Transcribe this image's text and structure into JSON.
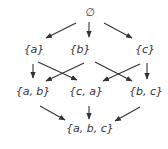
{
  "diagram": {
    "nodes": [
      {
        "id": "empty",
        "label": "∅",
        "x": 90,
        "y": 16
      },
      {
        "id": "a",
        "label": "{a}",
        "x": 34,
        "y": 53
      },
      {
        "id": "b",
        "label": "{b}",
        "x": 80,
        "y": 53
      },
      {
        "id": "c",
        "label": "{c}",
        "x": 145,
        "y": 53
      },
      {
        "id": "ab",
        "label": "{a, b}",
        "x": 33,
        "y": 95
      },
      {
        "id": "ca",
        "label": "{c, a}",
        "x": 86,
        "y": 95
      },
      {
        "id": "bc",
        "label": "{b, c}",
        "x": 146,
        "y": 95
      },
      {
        "id": "abc",
        "label": "{a, b, c}",
        "x": 90,
        "y": 132
      }
    ],
    "edges": [
      {
        "from": "empty",
        "to": "a",
        "x1": 76,
        "y1": 23,
        "x2": 46,
        "y2": 38
      },
      {
        "from": "empty",
        "to": "b",
        "x1": 89,
        "y1": 22,
        "x2": 89,
        "y2": 37
      },
      {
        "from": "empty",
        "to": "c",
        "x1": 104,
        "y1": 23,
        "x2": 132,
        "y2": 38
      },
      {
        "from": "a",
        "to": "ab",
        "x1": 33,
        "y1": 64,
        "x2": 33,
        "y2": 78
      },
      {
        "from": "a",
        "to": "ca",
        "x1": 38,
        "y1": 62,
        "x2": 77,
        "y2": 80
      },
      {
        "from": "b",
        "to": "ab",
        "x1": 84,
        "y1": 63,
        "x2": 46,
        "y2": 81
      },
      {
        "from": "b",
        "to": "bc",
        "x1": 95,
        "y1": 62,
        "x2": 132,
        "y2": 81
      },
      {
        "from": "c",
        "to": "ca",
        "x1": 140,
        "y1": 64,
        "x2": 103,
        "y2": 81
      },
      {
        "from": "c",
        "to": "bc",
        "x1": 147,
        "y1": 63,
        "x2": 147,
        "y2": 79
      },
      {
        "from": "ab",
        "to": "abc",
        "x1": 40,
        "y1": 106,
        "x2": 65,
        "y2": 120
      },
      {
        "from": "ca",
        "to": "abc",
        "x1": 89,
        "y1": 106,
        "x2": 89,
        "y2": 119
      },
      {
        "from": "bc",
        "to": "abc",
        "x1": 140,
        "y1": 107,
        "x2": 115,
        "y2": 121
      }
    ],
    "colors": {
      "stroke": "#333333",
      "text": "#333333",
      "background": "#ffffff"
    }
  }
}
